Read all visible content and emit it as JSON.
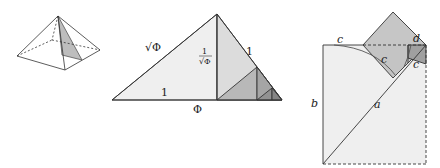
{
  "figure": {
    "panels": [
      {
        "id": "pyramid",
        "description": "square pyramid with shaded internal right triangle"
      },
      {
        "id": "kepler-triangle",
        "labels": {
          "hyp": "√Φ",
          "height": "1/√Φ",
          "height_num": "1",
          "height_den": "√Φ",
          "side": "1",
          "base_inner": "1",
          "base": "Φ"
        }
      },
      {
        "id": "square-construction",
        "labels": {
          "top_c": "c",
          "inner_c": "c",
          "d": "d",
          "right_c": "c",
          "b": "b",
          "a": "a"
        }
      }
    ],
    "colors": {
      "light_fill": "#ececec",
      "mid_fill": "#d6d6d6",
      "dark_fill": "#a9a9a9",
      "darker_fill": "#8e8e8e",
      "stroke": "#333333"
    }
  }
}
